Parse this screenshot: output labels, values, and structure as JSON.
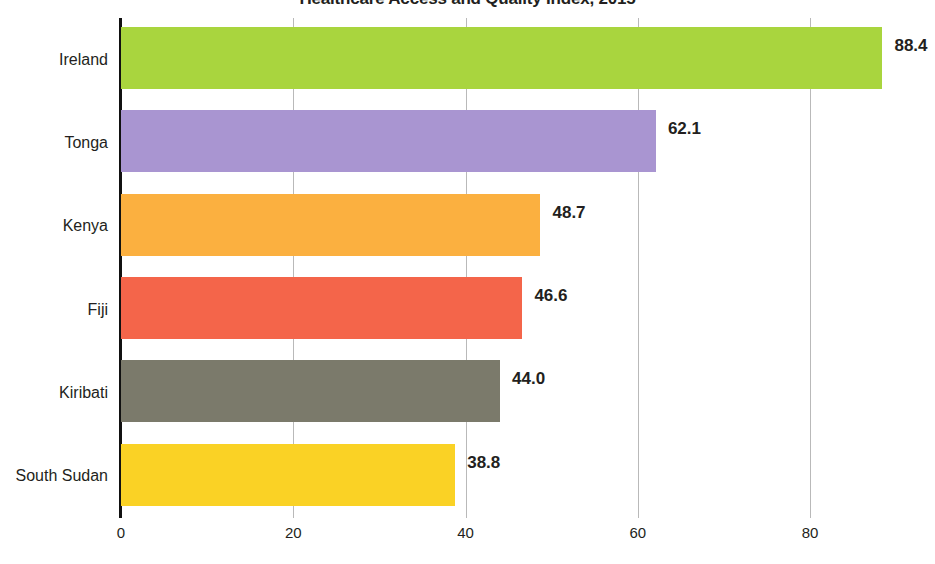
{
  "chart_data": {
    "type": "bar",
    "orientation": "horizontal",
    "title": "Healthcare Access and Quality Index, 2015",
    "xlabel": "",
    "ylabel": "",
    "xlim": [
      0,
      94.5
    ],
    "xticks": [
      0,
      20,
      40,
      60,
      80
    ],
    "grid": true,
    "legend": "none",
    "categories": [
      "Ireland",
      "Tonga",
      "Kenya",
      "Fiji",
      "Kiribati",
      "South Sudan"
    ],
    "values": [
      88.4,
      62.1,
      48.7,
      46.6,
      44.0,
      38.8
    ],
    "value_labels": [
      "88.4",
      "62.1",
      "48.7",
      "46.6",
      "44.0",
      "38.8"
    ],
    "colors": [
      "#a9d53e",
      "#a995d1",
      "#fbb040",
      "#f4654a",
      "#7b7a6b",
      "#fad225"
    ],
    "axis_color": "#111111",
    "gridline_color": "#b9b9b9",
    "text_color": "#231f20",
    "background": "#ffffff"
  }
}
